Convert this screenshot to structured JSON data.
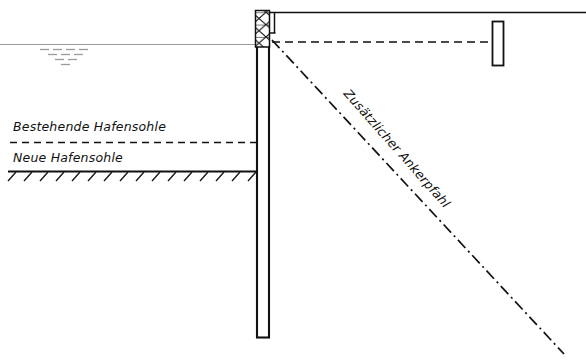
{
  "diagram": {
    "labels": {
      "existing_harbour_bottom": "Bestehende Hafensohle",
      "new_harbour_bottom": "Neue Hafensohle",
      "additional_anchor_pile": "Zusätzlicher Ankerpfahl"
    },
    "colors": {
      "ink": "#111111",
      "water_line": "#8a8a8a",
      "background": "#ffffff"
    },
    "elements": {
      "ground_surface_line": "ground-surface-line",
      "water_surface_line": "water-surface-line",
      "water_level_symbol": "water-level-symbol",
      "sheet_pile_wall": "sheet-pile-wall",
      "wall_head_hatched_block": "wall-head-hatched-block",
      "existing_bottom_dashed_line": "existing-harbour-bottom-line",
      "new_bottom_solid_line": "new-harbour-bottom-line",
      "soil_hatching": "soil-hatching",
      "anchor_tie_rod": "anchor-tie-rod-dashed",
      "anchor_wall_plate": "anchor-wall-plate",
      "additional_anchor_pile_line": "additional-anchor-pile-dashdot"
    },
    "geometry": {
      "ground_surface_y": 12,
      "water_surface_y": 44,
      "existing_bottom_y": 142,
      "new_bottom_y": 171,
      "wall_left_x": 256,
      "wall_right_x": 270,
      "wall_bottom_y": 338,
      "hatch_block_top_y": 10,
      "hatch_block_bottom_y": 47,
      "anchor_node_x": 272,
      "anchor_node_y": 42,
      "anchor_plate_x": 492,
      "anchor_plate_top_y": 21,
      "anchor_plate_bottom_y": 66,
      "pile_end_x": 562,
      "pile_end_y": 352
    }
  }
}
